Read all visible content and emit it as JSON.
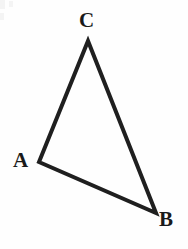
{
  "figure": {
    "background_color": "#fefefe",
    "stroke_color": "#1f1f1f",
    "stroke_width": 4,
    "label_color": "#1a1a1a",
    "width": 188,
    "height": 249
  },
  "chart_data": {
    "type": "diagram",
    "shape": "triangle",
    "vertices": [
      {
        "name": "A",
        "x": 39,
        "y": 162,
        "label_x": 13,
        "label_y": 150
      },
      {
        "name": "B",
        "x": 156,
        "y": 213,
        "label_x": 159,
        "label_y": 209
      },
      {
        "name": "C",
        "x": 88,
        "y": 41,
        "label_x": 79,
        "label_y": 10
      }
    ],
    "edges": [
      {
        "from": "A",
        "to": "C"
      },
      {
        "from": "C",
        "to": "B"
      },
      {
        "from": "B",
        "to": "A"
      }
    ],
    "path": "M 39 162 L 88 41 L 156 213 Z"
  },
  "labels": {
    "a": "A",
    "b": "B",
    "c": "C"
  }
}
